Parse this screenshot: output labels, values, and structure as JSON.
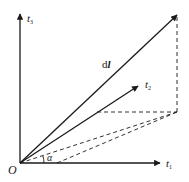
{
  "diagram": {
    "title": "",
    "colors": {
      "stroke": "#1a1a1a",
      "background": "#ffffff"
    },
    "origin": {
      "label": "O"
    },
    "axes": [
      {
        "id": "t1",
        "label": "t",
        "subscript": "1",
        "direction": "horizontal"
      },
      {
        "id": "t3",
        "label": "t",
        "subscript": "3",
        "direction": "vertical"
      }
    ],
    "vectors": [
      {
        "id": "dl",
        "label": "d",
        "label_bold": "l"
      },
      {
        "id": "t2",
        "label": "t",
        "subscript": "2"
      }
    ],
    "angle": {
      "label": "α",
      "between": [
        "t1",
        "projection"
      ]
    },
    "dashed_lines": [
      "vertical-drop-from-dl",
      "horizontal-to-t2-projection",
      "projection-from-origin",
      "from-t1-axis-to-projection"
    ]
  }
}
